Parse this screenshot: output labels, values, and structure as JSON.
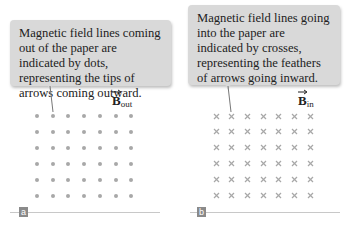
{
  "panels": [
    {
      "id": "a",
      "label": "a",
      "callout_text": "Magnetic field lines coming out of the paper are indicated by dots, representing the tips of arrows coming outward.",
      "field_symbol": "B",
      "field_subscript": "out",
      "marker": "dot",
      "grid": {
        "columns": 7,
        "rows": 6
      }
    },
    {
      "id": "b",
      "label": "b",
      "callout_text": "Magnetic field lines going into the paper are indicated by crosses, representing the feathers of arrows going inward.",
      "field_symbol": "B",
      "field_subscript": "in",
      "marker": "cross",
      "grid": {
        "columns": 7,
        "rows": 6
      }
    }
  ],
  "colors": {
    "callout_bg": "#d9d9d9",
    "marker": "#a8a8a8",
    "label_bg": "#8a8a8a",
    "baseline": "#c8c8c8"
  }
}
